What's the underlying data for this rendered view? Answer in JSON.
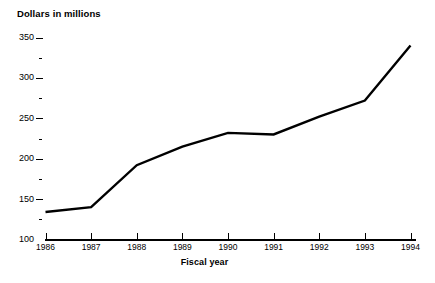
{
  "chart_data": {
    "type": "line",
    "title": "",
    "ylabel": "Dollars in millions",
    "xlabel": "Fiscal year",
    "categories": [
      "1986",
      "1987",
      "1988",
      "1989",
      "1990",
      "1991",
      "1992",
      "1993",
      "1994"
    ],
    "values": [
      134,
      140,
      192,
      215,
      232,
      230,
      252,
      272,
      340
    ],
    "series": [
      {
        "name": "Dollars in millions",
        "values": [
          134,
          140,
          192,
          215,
          232,
          230,
          252,
          272,
          340
        ]
      }
    ],
    "ylim": [
      100,
      350
    ],
    "y_major_ticks": [
      100,
      150,
      200,
      250,
      300,
      350
    ],
    "y_minor_ticks": [
      125,
      175,
      225,
      275,
      325
    ],
    "y_tick_labels": [
      "100",
      "150",
      "200",
      "250",
      "300",
      "350"
    ],
    "grid": false,
    "legend": "none",
    "line_color": "#000000",
    "line_width": 2.4,
    "background_color": "#ffffff"
  },
  "axes": {
    "y_title": "Dollars in millions",
    "x_title": "Fiscal year"
  }
}
